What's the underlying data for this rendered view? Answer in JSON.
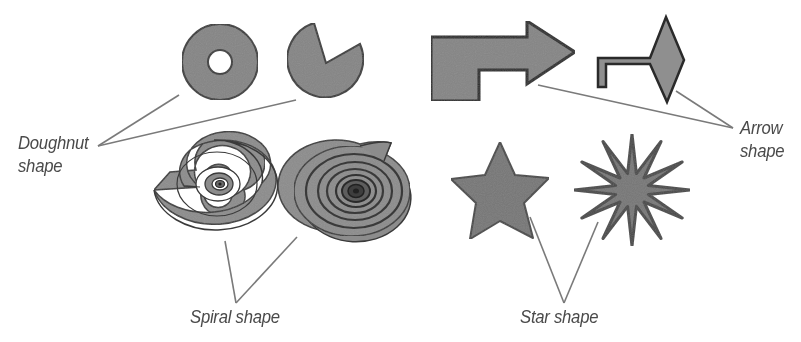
{
  "diagram": {
    "title": "",
    "colors": {
      "fill": "#8a8a8a",
      "fill_dark": "#6e6e6e",
      "outline": "#3a3a3a",
      "leader_line": "#7a7a7a",
      "label_text": "#4a4a4a",
      "background": "#ffffff"
    },
    "groups": [
      {
        "id": "doughnut",
        "label_line1": "Doughnut",
        "label_line2": "shape",
        "shapes": [
          "doughnut-ring",
          "pie-with-wedge-removed"
        ]
      },
      {
        "id": "arrow",
        "label_line1": "Arrow",
        "label_line2": "shape",
        "shapes": [
          "bent-block-arrow",
          "bent-line-arrow-with-diamond-head"
        ]
      },
      {
        "id": "spiral",
        "label": "Spiral shape",
        "shapes": [
          "open-spiral-with-gap",
          "tight-spiral"
        ]
      },
      {
        "id": "star",
        "label": "Star shape",
        "shapes": [
          "five-point-star",
          "twelve-point-star-burst"
        ]
      }
    ]
  }
}
